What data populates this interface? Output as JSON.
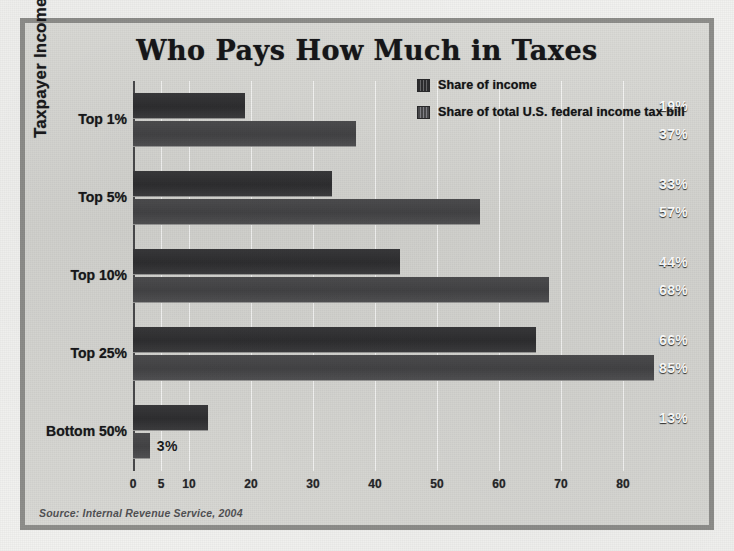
{
  "title": "Who Pays How Much in Taxes",
  "y_axis_title": "Taxpayer Income Level",
  "source_note": "Source: Internal Revenue Service, 2004",
  "legend": {
    "items": [
      {
        "label": "Share of income",
        "color": "#2f2f31"
      },
      {
        "label": "Share of total U.S. federal income tax bill",
        "color": "#444446"
      }
    ]
  },
  "colors": {
    "frame_border": "#8f8f8c",
    "plate_background": "#d8d8d4",
    "series_income": "#2f2f31",
    "series_tax": "#444446",
    "gridline": "#ffffff",
    "axis": "#4a4a4c",
    "title_text": "#17171a",
    "label_text": "#ffffff"
  },
  "chart_data": {
    "type": "bar",
    "orientation": "horizontal",
    "title": "Who Pays How Much in Taxes",
    "xlabel": "",
    "ylabel": "Taxpayer Income Level",
    "categories": [
      "Top 1%",
      "Top 5%",
      "Top 10%",
      "Top 25%",
      "Bottom 50%"
    ],
    "series": [
      {
        "name": "Share of income",
        "values": [
          19,
          33,
          44,
          66,
          13
        ],
        "labels": [
          "19%",
          "33%",
          "44%",
          "66%",
          "13%"
        ]
      },
      {
        "name": "Share of total U.S. federal income tax bill",
        "values": [
          37,
          57,
          68,
          85,
          3
        ],
        "labels": [
          "37%",
          "57%",
          "68%",
          "85%",
          "3%"
        ]
      }
    ],
    "xticks": [
      0,
      5,
      10,
      20,
      30,
      40,
      50,
      60,
      70,
      80
    ],
    "xticklabels": [
      "0",
      "5",
      "10",
      "20",
      "30",
      "40",
      "50",
      "60",
      "70",
      "80"
    ],
    "xlim": [
      0,
      87
    ],
    "grid": true,
    "grid_axis": "x",
    "legend_position": "upper right",
    "value_labels": true,
    "source": "Source: Internal Revenue Service, 2004"
  }
}
